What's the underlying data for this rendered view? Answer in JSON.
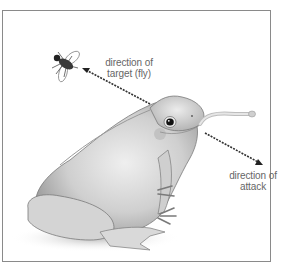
{
  "figure": {
    "labels": {
      "target_line1": "direction of",
      "target_line2": "target (fly)",
      "attack_line1": "direction of",
      "attack_line2": "attack"
    },
    "elements": [
      "frog",
      "fly",
      "tongue",
      "arrow-to-fly",
      "arrow-attack"
    ],
    "colors": {
      "frame": "#8a8a8a",
      "text": "#666666",
      "arrow": "#333333",
      "frog_body": "#c9c9c9"
    }
  }
}
